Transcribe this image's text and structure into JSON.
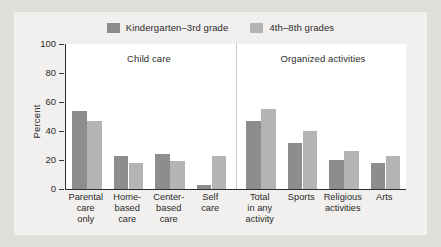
{
  "chart_data": {
    "type": "bar",
    "title": "",
    "xlabel": "",
    "ylabel": "Percent",
    "ylim": [
      0,
      100
    ],
    "yticks": [
      0,
      20,
      40,
      60,
      80,
      100
    ],
    "grid": false,
    "legend_position": "top-center",
    "panels": [
      {
        "name": "Child care",
        "categories": [
          "Parental care only",
          "Home-based care",
          "Center-based care",
          "Self care"
        ],
        "category_lines": [
          [
            "Parental",
            "care",
            "only"
          ],
          [
            "Home-",
            "based",
            "care"
          ],
          [
            "Center-",
            "based",
            "care"
          ],
          [
            "Self",
            "care"
          ]
        ],
        "series": [
          {
            "name": "Kindergarten–3rd grade",
            "values": [
              54,
              23,
              24,
              3
            ]
          },
          {
            "name": "4th–8th grades",
            "values": [
              47,
              18,
              19,
              23
            ]
          }
        ]
      },
      {
        "name": "Organized activities",
        "categories": [
          "Total in any activity",
          "Sports",
          "Religious activities",
          "Arts"
        ],
        "category_lines": [
          [
            "Total",
            "in any",
            "activity"
          ],
          [
            "Sports"
          ],
          [
            "Religious",
            "activities"
          ],
          [
            "Arts"
          ]
        ],
        "series": [
          {
            "name": "Kindergarten–3rd grade",
            "values": [
              47,
              32,
              20,
              18
            ]
          },
          {
            "name": "4th–8th grades",
            "values": [
              55,
              40,
              26,
              23
            ]
          }
        ]
      }
    ],
    "legend": [
      {
        "label": "Kindergarten–3rd grade",
        "color": "#8d8d8d"
      },
      {
        "label": "4th–8th grades",
        "color": "#b4b4b4"
      }
    ]
  },
  "colors": {
    "series_dark": "#8d8d8d",
    "series_light": "#b4b4b4",
    "figure_background": "#f1f0ee",
    "page_background": "#dededa",
    "plot_background": "#ffffff",
    "axis": "#2c2c2c",
    "text": "#2b2b2b"
  }
}
